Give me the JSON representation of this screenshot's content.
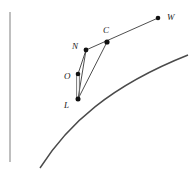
{
  "figure": {
    "background_color": "#ffffff",
    "stroke_color": "#3a3a3a",
    "curve_color": "#4a4a4a",
    "label_color": "#1a1a1a",
    "width": 195,
    "height": 173
  },
  "axis": {
    "name": "vertical-axis-line",
    "x": 10,
    "y_top": 12,
    "y_bottom": 162,
    "color": "#8a8a8a"
  },
  "points": [
    {
      "id": "W",
      "label": "W",
      "x": 158,
      "y": 18,
      "label_x": 167,
      "label_y": 20
    },
    {
      "id": "C",
      "label": "C",
      "x": 107,
      "y": 42,
      "label_x": 103,
      "label_y": 33
    },
    {
      "id": "N",
      "label": "N",
      "x": 86,
      "y": 50,
      "label_x": 72,
      "label_y": 49
    },
    {
      "id": "O",
      "label": "O",
      "x": 78,
      "y": 74,
      "label_x": 64,
      "label_y": 79
    },
    {
      "id": "L",
      "label": "L",
      "x": 78,
      "y": 99,
      "label_x": 64,
      "label_y": 108
    }
  ],
  "segments": [
    {
      "name": "segment-O-L",
      "from": "O",
      "to": "L",
      "x1": 78,
      "y1": 74,
      "x2": 78,
      "y2": 99,
      "style": "double"
    },
    {
      "name": "segment-L-N",
      "from": "L",
      "to": "N",
      "x1": 78,
      "y1": 99,
      "x2": 86,
      "y2": 50,
      "style": "single"
    },
    {
      "name": "segment-L-C",
      "from": "L",
      "to": "C",
      "x1": 78,
      "y1": 99,
      "x2": 107,
      "y2": 42,
      "style": "single"
    },
    {
      "name": "segment-O-N",
      "from": "O",
      "to": "N",
      "x1": 78,
      "y1": 74,
      "x2": 86,
      "y2": 50,
      "style": "single"
    },
    {
      "name": "segment-N-C-W",
      "from": "N",
      "to": "W",
      "x1": 86,
      "y1": 50,
      "x2": 158,
      "y2": 18,
      "style": "single"
    }
  ],
  "curve": {
    "name": "concave-curve",
    "start_x": 40,
    "start_y": 168,
    "control1_x": 68,
    "control1_y": 124,
    "control2_x": 110,
    "control2_y": 86,
    "end_x": 188,
    "end_y": 55,
    "color": "#4a4a4a"
  }
}
